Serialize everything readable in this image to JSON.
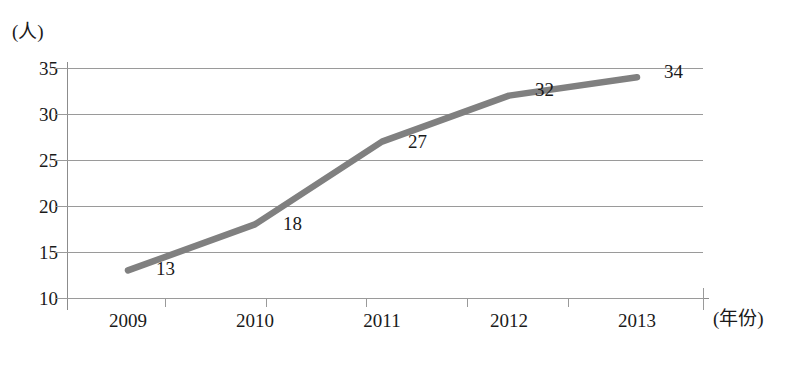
{
  "chart_data": {
    "type": "line",
    "title": "",
    "xlabel": "(年份)",
    "ylabel": "(人)",
    "categories": [
      "2009",
      "2010",
      "2011",
      "2012",
      "2013"
    ],
    "values": [
      13,
      18,
      27,
      32,
      34
    ],
    "point_labels": [
      "13",
      "18",
      "27",
      "32",
      "34"
    ],
    "series": [
      {
        "name": "",
        "values": [
          13,
          18,
          27,
          32,
          34
        ]
      }
    ],
    "ylim": [
      10,
      35
    ],
    "yticks": [
      "10",
      "15",
      "20",
      "25",
      "30",
      "35"
    ],
    "grid": true,
    "legend": "none",
    "series_color": "#808080",
    "grid_color": "#9a9a9a",
    "axis_color": "#8c8c8c",
    "text_color": "#1a1a1a"
  },
  "axis": {
    "y_unit": "(人)",
    "x_unit": "(年份)"
  }
}
